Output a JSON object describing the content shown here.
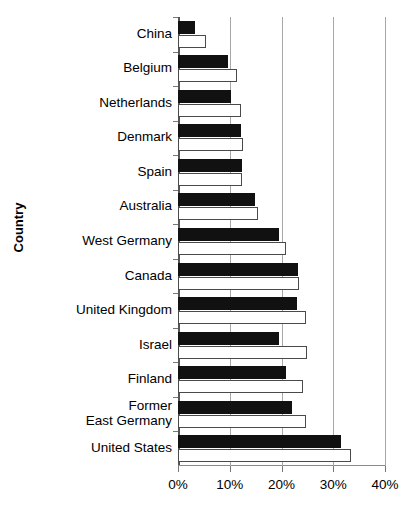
{
  "chart_data": {
    "type": "bar",
    "title": "",
    "xlabel": "",
    "ylabel": "Country",
    "orientation": "horizontal",
    "grid": true,
    "legend": "none",
    "xlim": [
      0,
      40
    ],
    "xtick_labels": [
      "0%",
      "10%",
      "20%",
      "30%",
      "40%"
    ],
    "xticks": [
      0,
      10,
      20,
      30,
      40
    ],
    "categories": [
      "China",
      "Belgium",
      "Netherlands",
      "Denmark",
      "Spain",
      "Australia",
      "West Germany",
      "Canada",
      "United Kingdom",
      "Israel",
      "Finland",
      "Former East Germany",
      "United States"
    ],
    "category_lines": [
      [
        "China"
      ],
      [
        "Belgium"
      ],
      [
        "Netherlands"
      ],
      [
        "Denmark"
      ],
      [
        "Spain"
      ],
      [
        "Australia"
      ],
      [
        "West Germany"
      ],
      [
        "Canada"
      ],
      [
        "United Kingdom"
      ],
      [
        "Israel"
      ],
      [
        "Finland"
      ],
      [
        "Former",
        "East Germany"
      ],
      [
        "United States"
      ]
    ],
    "series": [
      {
        "name": "series-dark",
        "color": "#111111",
        "values": [
          3.3,
          9.7,
          10.2,
          12.2,
          12.3,
          14.8,
          19.6,
          23.1,
          22.9,
          19.6,
          20.9,
          22.0,
          31.5
        ]
      },
      {
        "name": "series-light",
        "color": "#ffffff",
        "values": [
          5.5,
          11.4,
          12.1,
          12.6,
          12.4,
          15.4,
          20.9,
          23.3,
          24.8,
          25.0,
          24.1,
          24.8,
          33.4
        ]
      }
    ]
  }
}
